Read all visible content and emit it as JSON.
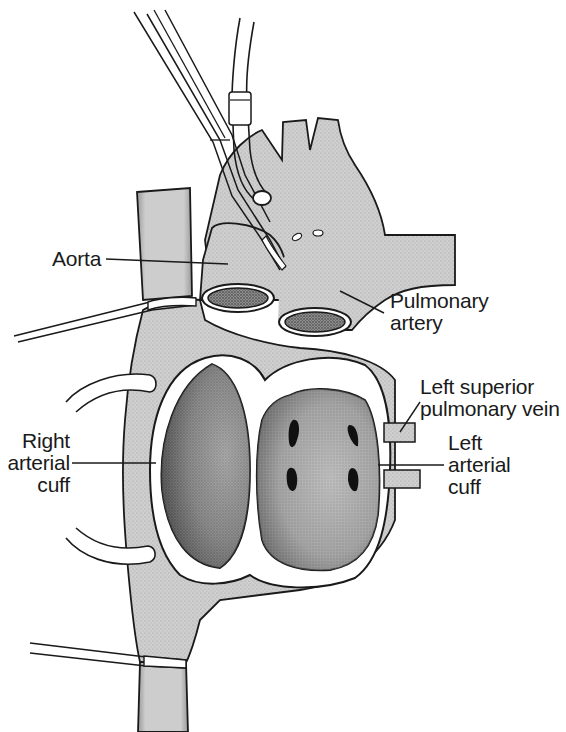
{
  "figure": {
    "type": "anatomical-surgical-illustration",
    "colors": {
      "background": "#ffffff",
      "tissue": "#c9c9c9",
      "tissue_shade": "#8a8a8a",
      "atrium_interior": "#6e6e6e",
      "vessel_lumen": "#2a2a2a",
      "outline": "#1a1a1a",
      "label_text": "#1a1a1a"
    }
  },
  "labels": {
    "aorta": "Aorta",
    "pulmonary_artery": "Pulmonary\nartery",
    "left_superior_pulmonary_vein": "Left superior\npulmonary vein",
    "left_arterial_cuff": "Left\narterial\ncuff",
    "right_arterial_cuff": "Right\narterial\ncuff"
  },
  "structures": [
    "forceps",
    "cannula-tube",
    "aorta",
    "pulmonary-artery",
    "superior-vena-cava",
    "inferior-vena-cava",
    "right-atrial-cuff",
    "left-atrial-cuff",
    "pulmonary-vein-openings",
    "ligature-ties",
    "retraction-sutures"
  ]
}
